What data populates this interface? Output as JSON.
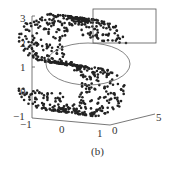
{
  "chart_data": {
    "type": "scatter",
    "subtype": "3d-scatter",
    "title": "",
    "caption": "(b)",
    "y_axis": {
      "ticks": [
        "3",
        "2",
        "1",
        "0",
        "-1"
      ],
      "range": [
        -1,
        3
      ]
    },
    "x_axis": {
      "ticks": [
        "-1",
        "0",
        "1"
      ],
      "range": [
        -1,
        1
      ]
    },
    "z_axis": {
      "ticks": [
        "0",
        "5"
      ],
      "range": [
        0,
        5
      ]
    },
    "annotations": [
      {
        "type": "rectangle",
        "region": "upper-right, y approx 2 to 3"
      },
      {
        "type": "ellipse",
        "region": "center, y approx 0.5 to 2"
      }
    ],
    "point_color": "#222222",
    "grid": false,
    "legend": false
  },
  "labels": {
    "y3": "3",
    "y2": "2",
    "y1": "1",
    "y0": "0",
    "ym1": "−1",
    "xm1": "−1",
    "x0": "0",
    "x1": "1",
    "z0": "0",
    "z5": "5",
    "caption": "(b)"
  }
}
